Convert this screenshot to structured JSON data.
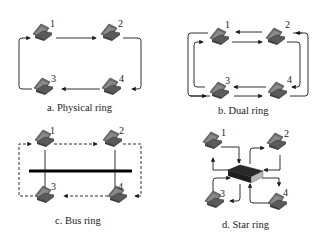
{
  "panels": [
    {
      "id": "a",
      "caption": "a. Physical ring",
      "nodes": [
        "1",
        "2",
        "3",
        "4"
      ]
    },
    {
      "id": "b",
      "caption": "b. Dual ring",
      "nodes": [
        "1",
        "2",
        "3",
        "4"
      ]
    },
    {
      "id": "c",
      "caption": "c. Bus ring",
      "nodes": [
        "1",
        "2",
        "3",
        "4"
      ]
    },
    {
      "id": "d",
      "caption": "d. Star ring",
      "nodes": [
        "1",
        "2",
        "3",
        "4"
      ]
    }
  ],
  "icons": {
    "node": "laptop-icon",
    "hub": "hub-icon"
  },
  "colors": {
    "line": "#1a1a1a",
    "laptop_body": "#6e6e6e",
    "laptop_dark": "#3c3c3c",
    "hub_top": "#2a2a2a",
    "hub_side": "#b8b8b8"
  }
}
